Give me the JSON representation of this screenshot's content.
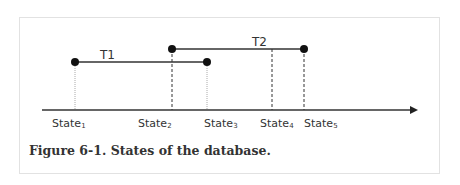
{
  "figure": {
    "caption": "Figure 6-1. States of the database.",
    "colors": {
      "line": "#333333",
      "dot": "#111111",
      "frame": "#e2e2e2",
      "dotted_guide": "#999999"
    }
  },
  "transactions": [
    {
      "label": "T1",
      "start_state": "State1",
      "end_state": "State3"
    },
    {
      "label": "T2",
      "start_state": "State2",
      "end_state": "State5"
    }
  ],
  "states": [
    {
      "base": "State",
      "sub": "1"
    },
    {
      "base": "State",
      "sub": "2"
    },
    {
      "base": "State",
      "sub": "3"
    },
    {
      "base": "State",
      "sub": "4"
    },
    {
      "base": "State",
      "sub": "5"
    }
  ]
}
